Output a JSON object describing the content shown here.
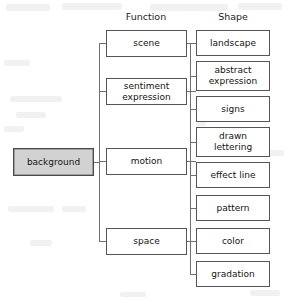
{
  "diagram": {
    "type": "hierarchy-tree",
    "root": {
      "label": "background",
      "fill": "#d2d2d2"
    },
    "columns": [
      {
        "key": "function",
        "header": "Function"
      },
      {
        "key": "shape",
        "header": "Shape"
      }
    ],
    "function_nodes": [
      {
        "label": "scene"
      },
      {
        "label": "sentiment\nexpression"
      },
      {
        "label": "motion"
      },
      {
        "label": "space"
      }
    ],
    "shape_nodes": [
      {
        "label": "landscape"
      },
      {
        "label": "abstract\nexpression"
      },
      {
        "label": "signs"
      },
      {
        "label": "drawn\nlettering"
      },
      {
        "label": "effect line"
      },
      {
        "label": "pattern"
      },
      {
        "label": "color"
      },
      {
        "label": "gradation"
      }
    ],
    "edge_color": "#707070",
    "box_border_color": "#555555"
  }
}
